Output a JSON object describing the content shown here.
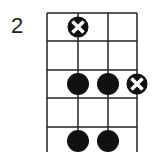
{
  "diagram": {
    "type": "chord-diagram",
    "starting_fret_label": "2",
    "strings": 4,
    "frets_shown": 5,
    "markers": [
      {
        "string": 2,
        "fret": 1,
        "type": "x-circle"
      },
      {
        "string": 2,
        "fret": 3,
        "type": "dot"
      },
      {
        "string": 3,
        "fret": 3,
        "type": "dot"
      },
      {
        "string": 4,
        "fret": 3,
        "type": "x-circle"
      },
      {
        "string": 2,
        "fret": 5,
        "type": "dot"
      },
      {
        "string": 3,
        "fret": 5,
        "type": "dot"
      }
    ],
    "colors": {
      "line": "#222222",
      "dot": "#111111",
      "x_mark": "#ffffff"
    }
  }
}
